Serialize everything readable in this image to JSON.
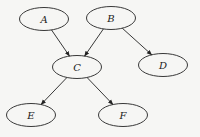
{
  "diagram": {
    "type": "directed-graph",
    "nodes": [
      {
        "id": "A",
        "label": "A",
        "cx": 44,
        "cy": 19
      },
      {
        "id": "B",
        "label": "B",
        "cx": 111,
        "cy": 18
      },
      {
        "id": "C",
        "label": "C",
        "cx": 77,
        "cy": 67
      },
      {
        "id": "D",
        "label": "D",
        "cx": 163,
        "cy": 65
      },
      {
        "id": "E",
        "label": "E",
        "cx": 31,
        "cy": 115
      },
      {
        "id": "F",
        "label": "F",
        "cx": 123,
        "cy": 115
      }
    ],
    "edges": [
      {
        "from": "A",
        "to": "C"
      },
      {
        "from": "B",
        "to": "C"
      },
      {
        "from": "B",
        "to": "D"
      },
      {
        "from": "C",
        "to": "E"
      },
      {
        "from": "C",
        "to": "F"
      }
    ],
    "colors": {
      "background": "#f6f6f4",
      "stroke": "#222222"
    }
  }
}
